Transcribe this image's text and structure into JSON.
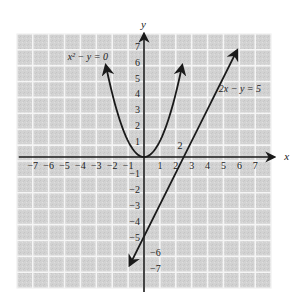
{
  "chart_data": {
    "type": "line",
    "title": "",
    "xlabel": "x",
    "ylabel": "y",
    "xlim": [
      -8,
      8
    ],
    "ylim": [
      -8,
      8
    ],
    "grid": true,
    "x_ticks": [
      -7,
      -6,
      -5,
      -4,
      -3,
      -2,
      -1,
      1,
      2,
      3,
      4,
      5,
      6,
      7
    ],
    "x_tick_labels": [
      "−7",
      "−6",
      "−5",
      "−4",
      "−3",
      "−2",
      "−1",
      "1",
      "2",
      "3",
      "4",
      "5",
      "6",
      "7"
    ],
    "y_ticks": [
      7,
      6,
      5,
      4,
      3,
      2,
      1,
      -1,
      -2,
      -3,
      -4,
      -5,
      -6,
      -7
    ],
    "y_tick_labels": [
      "7",
      "6",
      "5",
      "4",
      "3",
      "2",
      "1",
      "−1",
      "−2",
      "−3",
      "−4",
      "−5",
      "−6",
      "−7"
    ],
    "series": [
      {
        "name": "x² − y = 0",
        "label": "x² − y = 0",
        "equation": "y = x^2",
        "x_range": [
          -2.4,
          2.4
        ],
        "arrows": "both"
      },
      {
        "name": "2x − y = 5",
        "label": "2x − y = 5",
        "equation": "y = 2x - 5",
        "x_range": [
          -0.9,
          5.85
        ],
        "arrows": "both"
      }
    ],
    "annotations": [
      {
        "text": "2",
        "x": 2.1,
        "y": 0.5
      }
    ]
  },
  "colors": {
    "grid_fill": "#d4d4d4",
    "grid_line": "#f5f5f5",
    "curve": "#1a1a1a"
  }
}
